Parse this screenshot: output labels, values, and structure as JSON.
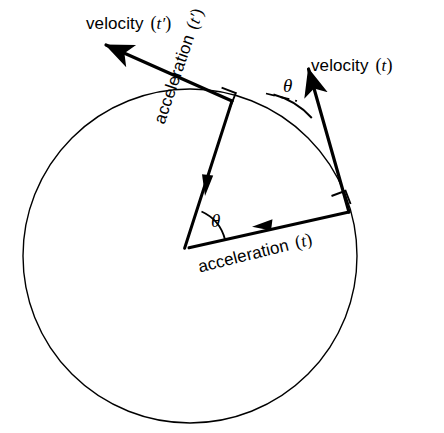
{
  "figure": {
    "background_color": "#ffffff",
    "stroke_color": "#000000",
    "width": 444,
    "height": 433
  },
  "circle": {
    "name": "trajectory-circle",
    "center_x": 190,
    "center_y": 256,
    "radius": 167,
    "stroke_width": 1.4
  },
  "labels": {
    "velocity_tprime": {
      "text": "velocity",
      "arg_open": "(",
      "var": "t",
      "prime": "′",
      "arg_close": ")"
    },
    "velocity_t": {
      "text": "velocity",
      "arg_open": "(",
      "var": "t",
      "prime": "",
      "arg_close": ")"
    },
    "acceleration_tprime": {
      "text": "acceleration",
      "arg_open": "(",
      "var": "t",
      "prime": "′",
      "arg_close": ")"
    },
    "acceleration_t": {
      "text": "acceleration",
      "arg_open": "(",
      "var": "t",
      "prime": "",
      "arg_close": ")"
    },
    "theta_top": "θ",
    "theta_bottom": "θ"
  },
  "vectors": {
    "velocity_t": {
      "name": "velocity-t-vector",
      "tail_x": 349,
      "tail_y": 212,
      "tip_x": 306,
      "tip_y": 60,
      "stroke_width": 3.2
    },
    "velocity_tprime": {
      "name": "velocity-t-prime-vector",
      "tail_x": 232,
      "tail_y": 101,
      "tip_x": 99,
      "tip_y": 42,
      "stroke_width": 3.2
    },
    "acceleration_t": {
      "name": "acceleration-t-vector",
      "tail_x": 349,
      "tail_y": 212,
      "tip_x": 184,
      "tip_y": 249,
      "stroke_width": 3.0
    },
    "acceleration_tprime": {
      "name": "acceleration-t-prime-vector",
      "tail_x": 232,
      "tail_y": 101,
      "tip_x": 184,
      "tip_y": 249,
      "stroke_width": 3.0
    }
  },
  "angle_marks": {
    "theta_top": {
      "vertex_x": 349,
      "vertex_y": 212,
      "radius": 78,
      "note": "angle between dashed tangent reference and velocity (t)"
    },
    "theta_bottom": {
      "vertex_x": 184,
      "vertex_y": 249,
      "radius": 42,
      "note": "angle between the two acceleration vectors"
    }
  },
  "right_angle_marks": [
    {
      "name": "right-angle-upper",
      "vertex_x": 232,
      "vertex_y": 101,
      "size": 15
    },
    {
      "name": "right-angle-lower",
      "vertex_x": 349,
      "vertex_y": 212,
      "size": 15
    }
  ],
  "dashed_reference": {
    "name": "tangent-reference-dash",
    "x1": 268,
    "y1": 94,
    "x2": 296,
    "y2": 101
  }
}
